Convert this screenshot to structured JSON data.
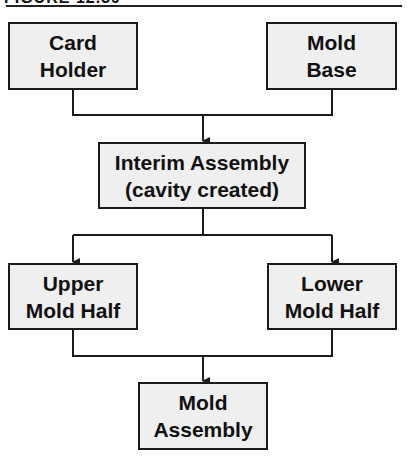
{
  "figure": {
    "title": "FIGURE 12.39"
  },
  "nodes": {
    "card_holder": {
      "line1": "Card",
      "line2": "Holder"
    },
    "mold_base": {
      "line1": "Mold",
      "line2": "Base"
    },
    "interim_assembly": {
      "line1": "Interim Assembly",
      "line2": "(cavity created)"
    },
    "upper_mold_half": {
      "line1": "Upper",
      "line2": "Mold Half"
    },
    "lower_mold_half": {
      "line1": "Lower",
      "line2": "Mold Half"
    },
    "mold_assembly": {
      "line1": "Mold",
      "line2": "Assembly"
    }
  },
  "edges": [
    {
      "from": "card_holder",
      "to": "interim_assembly"
    },
    {
      "from": "mold_base",
      "to": "interim_assembly"
    },
    {
      "from": "interim_assembly",
      "to": "upper_mold_half"
    },
    {
      "from": "interim_assembly",
      "to": "lower_mold_half"
    },
    {
      "from": "upper_mold_half",
      "to": "mold_assembly"
    },
    {
      "from": "lower_mold_half",
      "to": "mold_assembly"
    }
  ],
  "colors": {
    "box_fill": "#efefef",
    "stroke": "#1a1a1a"
  }
}
